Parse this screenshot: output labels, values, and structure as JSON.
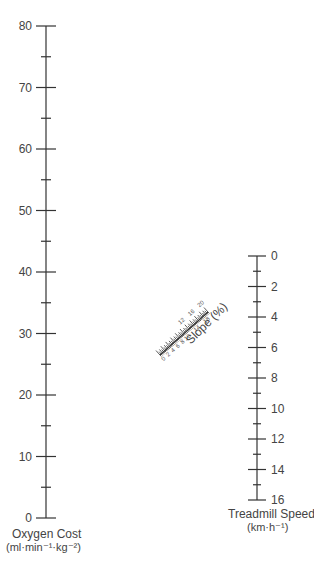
{
  "oxygen_axis": {
    "title": "Oxygen Cost",
    "units": "(ml·min⁻¹·kg⁻²)",
    "labels": [
      "80",
      "70",
      "60",
      "50",
      "40",
      "30",
      "20",
      "10",
      "0"
    ],
    "min": 0,
    "max": 80,
    "major_step": 10,
    "minor_step": 5
  },
  "slope_axis": {
    "title": "Slope (%)",
    "labels_below": [
      "0",
      "2",
      "4",
      "6",
      "8",
      "10",
      "14",
      "18"
    ],
    "labels_above": [
      "12",
      "16",
      "20"
    ],
    "min": 0,
    "max": 20
  },
  "speed_axis": {
    "title": "Treadmill Speed",
    "units": "(km·h⁻¹)",
    "labels": [
      "0",
      "2",
      "4",
      "6",
      "8",
      "10",
      "12",
      "14",
      "16"
    ],
    "min": 0,
    "max": 16,
    "major_step": 2,
    "minor_step": 1
  }
}
